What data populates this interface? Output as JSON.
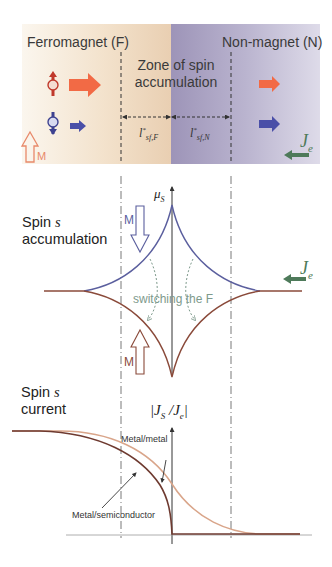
{
  "figure": {
    "top_panel": {
      "left_region_label": "Ferromagnet (F)",
      "right_region_label": "Non-magnet (N)",
      "zone_label_line1": "Zone of spin",
      "zone_label_line2": "accumulation",
      "length_left": "l*sf,F",
      "length_left_main": "l",
      "length_left_sup": "*",
      "length_left_sub": "sf,F",
      "length_right": "l*sf,N",
      "length_right_main": "l",
      "length_right_sup": "*",
      "length_right_sub": "sf,N",
      "magnetization_label": "M",
      "current_label": "J",
      "current_sub": "e",
      "colors": {
        "ferromagnet_bg": "#f0d9bf",
        "nonmagnet_bg": "#a79ec0",
        "spin_up": "#f26a45",
        "spin_down": "#4a4fa8",
        "current_arrow": "#4e7a5a",
        "magnetization": "#e8896a"
      }
    },
    "middle_panel": {
      "title_line1": "Spin ",
      "title_symbol": "s",
      "title_line2": "accumulation",
      "axis_label": "μ",
      "axis_sub": "S",
      "magnetization_label_top": "M",
      "magnetization_label_bottom": "M",
      "switching_label": "switching the F",
      "current_label": "J",
      "current_sub": "e",
      "colors": {
        "upper_curve": "#5b5f9e",
        "lower_curve": "#8a4a3a",
        "switch_arrows": "#7e9a8c"
      }
    },
    "bottom_panel": {
      "title_line1": "Spin ",
      "title_symbol": "s",
      "title_line2": "current",
      "axis_label": "|J",
      "axis_sub1": "S",
      "axis_mid": " /J",
      "axis_sub2": "e",
      "axis_end": "|",
      "curve_labels": [
        "Metal/metal",
        "Metal/semiconductor"
      ],
      "colors": {
        "metal_metal": "#d9a58a",
        "metal_semiconductor": "#6e3a30"
      }
    }
  }
}
